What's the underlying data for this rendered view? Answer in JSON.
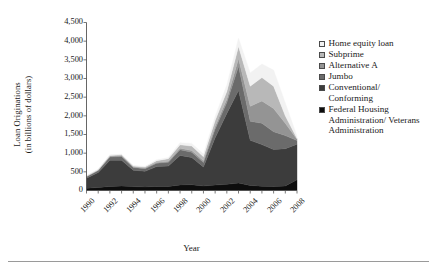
{
  "chart_data": {
    "type": "area",
    "title": "",
    "xlabel": "Year",
    "ylabel": "Loan Originations (in billions of dollars)",
    "ylabel_line1": "Loan Originations",
    "ylabel_line2": "(in billions of dollars)",
    "ylim": [
      0,
      4500
    ],
    "ytick_values": [
      0,
      500,
      1000,
      1500,
      2000,
      2500,
      3000,
      3500,
      4000,
      4500
    ],
    "ytick_labels": [
      "0",
      "500",
      "1,000",
      "1,500",
      "2,000",
      "2,500",
      "3,000",
      "3,500",
      "4,000",
      "4,500"
    ],
    "xlim": [
      1990,
      2008
    ],
    "x": [
      1990,
      1991,
      1992,
      1993,
      1994,
      1995,
      1996,
      1997,
      1998,
      1999,
      2000,
      2001,
      2002,
      2003,
      2004,
      2005,
      2006,
      2007,
      2008
    ],
    "xtick_values": [
      1990,
      1991,
      1992,
      1993,
      1994,
      1995,
      1996,
      1997,
      1998,
      1999,
      2000,
      2001,
      2002,
      2003,
      2004,
      2005,
      2006,
      2007,
      2008
    ],
    "xtick_labels_shown": [
      "1990",
      "1992",
      "1994",
      "1996",
      "1998",
      "2000",
      "2002",
      "2004",
      "2006",
      "2008"
    ],
    "grid": false,
    "legend_position": "right",
    "stacked": true,
    "stack_order_bottom_to_top": [
      "Federal Housing Administration/Veterans Administration",
      "Conventional/Conforming",
      "Jumbo",
      "Alternative A",
      "Subprime",
      "Home equity loan"
    ],
    "series": [
      {
        "name": "Federal Housing Administration/Veterans Administration",
        "color": "#0d0d0d",
        "values": [
          60,
          80,
          110,
          120,
          105,
          95,
          110,
          105,
          150,
          155,
          120,
          145,
          165,
          200,
          135,
          115,
          105,
          120,
          290
        ]
      },
      {
        "name": "Conventional/Conforming",
        "color": "#3c3c3c",
        "values": [
          270,
          400,
          700,
          690,
          440,
          420,
          530,
          550,
          790,
          730,
          510,
          1270,
          1900,
          2480,
          1210,
          1115,
          990,
          1000,
          950
        ]
      },
      {
        "name": "Jumbo",
        "color": "#6b6b6b",
        "values": [
          40,
          55,
          90,
          100,
          70,
          70,
          90,
          100,
          150,
          140,
          120,
          230,
          290,
          650,
          510,
          570,
          480,
          350,
          100
        ]
      },
      {
        "name": "Alternative A",
        "color": "#949494",
        "values": [
          8,
          10,
          18,
          20,
          16,
          16,
          22,
          26,
          40,
          45,
          45,
          70,
          90,
          200,
          400,
          600,
          620,
          330,
          35
        ]
      },
      {
        "name": "Subprime",
        "color": "#b8b8b8",
        "values": [
          10,
          14,
          22,
          25,
          22,
          28,
          48,
          70,
          95,
          120,
          110,
          160,
          210,
          330,
          540,
          625,
          600,
          200,
          20
        ]
      },
      {
        "name": "Home equity loan",
        "color": "#f2f2f2",
        "values": [
          8,
          10,
          15,
          18,
          16,
          18,
          24,
          32,
          55,
          70,
          70,
          110,
          170,
          220,
          355,
          365,
          430,
          345,
          60
        ]
      }
    ]
  },
  "legend": {
    "items": [
      {
        "label": "Home equity loan",
        "continuation": "",
        "color": "#f2f2f2"
      },
      {
        "label": "Subprime",
        "continuation": "",
        "color": "#b8b8b8"
      },
      {
        "label": "Alternative A",
        "continuation": "",
        "color": "#949494"
      },
      {
        "label": "Jumbo",
        "continuation": "",
        "color": "#6b6b6b"
      },
      {
        "label": "Conventional/",
        "continuation": "Conforming",
        "color": "#3c3c3c"
      },
      {
        "label": "Federal Housing",
        "continuation": "Administration/ Veterans Administration",
        "color": "#0d0d0d"
      }
    ]
  }
}
